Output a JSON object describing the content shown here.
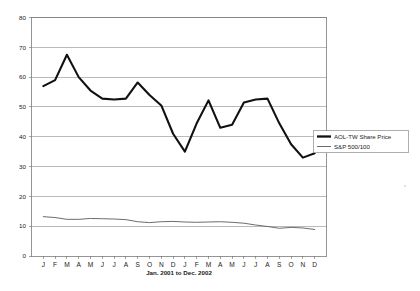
{
  "chart_data": {
    "type": "line",
    "title": "",
    "xlabel": "Jan. 2001 to Dec. 2002",
    "ylabel": "",
    "ylim": [
      0,
      80
    ],
    "yticks": [
      0,
      10,
      20,
      30,
      40,
      50,
      60,
      70,
      80
    ],
    "grid": true,
    "legend_position": "right-outside",
    "categories": [
      "J",
      "F",
      "M",
      "A",
      "M",
      "J",
      "J",
      "A",
      "S",
      "O",
      "N",
      "D",
      "J",
      "F",
      "M",
      "A",
      "M",
      "J",
      "J",
      "A",
      "S",
      "O",
      "N",
      "D"
    ],
    "x": [
      1,
      2,
      3,
      4,
      5,
      6,
      7,
      8,
      9,
      10,
      11,
      12,
      13,
      14,
      15,
      16,
      17,
      18,
      19,
      20,
      21,
      22,
      23,
      24
    ],
    "series": [
      {
        "name": "AOL-TW Share Price",
        "color": "#111111",
        "values": [
          57.0,
          59.0,
          67.5,
          60.0,
          55.5,
          52.8,
          52.5,
          52.8,
          58.2,
          54.0,
          50.5,
          41.0,
          35.0,
          44.5,
          52.2,
          43.0,
          44.0,
          51.5,
          52.5,
          52.8,
          44.5,
          37.5,
          33.0,
          34.5
        ]
      },
      {
        "name": "S&P 500/100",
        "color": "#5b5b5b",
        "values": [
          13.2,
          12.9,
          12.3,
          12.3,
          12.6,
          12.5,
          12.4,
          12.2,
          11.5,
          11.2,
          11.5,
          11.6,
          11.4,
          11.3,
          11.4,
          11.5,
          11.3,
          11.0,
          10.4,
          9.9,
          9.3,
          9.6,
          9.4,
          8.9
        ]
      }
    ]
  },
  "axes": {
    "y_tick_labels": [
      "0",
      "10",
      "20",
      "30",
      "40",
      "50",
      "60",
      "70",
      "80"
    ],
    "x_tick_labels": [
      "J",
      "F",
      "M",
      "A",
      "M",
      "J",
      "J",
      "A",
      "S",
      "O",
      "N",
      "D",
      "J",
      "F",
      "M",
      "A",
      "M",
      "J",
      "J",
      "A",
      "S",
      "O",
      "N",
      "D"
    ],
    "x_axis_title": "Jan. 2001 to Dec. 2002"
  },
  "legend": {
    "entries": [
      {
        "label": "AOL-TW Share Price",
        "style": "thick-line",
        "color": "#111111"
      },
      {
        "label": "S&P 500/100",
        "style": "thin-line",
        "color": "#5b5b5b"
      }
    ]
  }
}
